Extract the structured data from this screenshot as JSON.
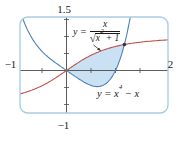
{
  "labels": {
    "curve1": {
      "pre": "y =",
      "num": "x",
      "radical_sign": "√",
      "rad_base": "x",
      "rad_exp": "2",
      "rad_tail": " + 1"
    },
    "curve2": {
      "pre": "y = x",
      "exp": "4",
      "post": " − x"
    }
  },
  "chart_data": {
    "type": "line",
    "title": "",
    "x_axis_range": [
      -1,
      2
    ],
    "y_axis_range": [
      -1,
      1.5
    ],
    "axes": {
      "x_ticks": [
        -0.5,
        0.5,
        1,
        1.5
      ],
      "y_ticks": [
        -1,
        -0.5,
        0.5,
        1,
        1.5
      ],
      "tick_step": 0.5,
      "x_min_label": "−1",
      "x_max_label": "2",
      "y_min_label": "−1",
      "y_max_label": "1.5"
    },
    "curves": [
      {
        "name": "y = x/sqrt(x^2+1)",
        "expr": "x/Math.sqrt(x*x+1)",
        "color": "#c1544a",
        "sample_range": [
          -0.95,
          2.09
        ]
      },
      {
        "name": "y = x^4 - x",
        "expr": "Math.pow(x,4)-x",
        "color": "#4e80b8",
        "sample_range": [
          -1.02,
          1.47
        ]
      }
    ],
    "region": {
      "x_from": 0,
      "x_to": 1.1811,
      "upper_curve": 0,
      "lower_curve": 1,
      "fill": "#c9e1f3"
    },
    "intersection_point": {
      "x": 1.1811,
      "y": 0.7628
    },
    "colors": {
      "frame": "#a9cce6",
      "axis": "#4a4a4a",
      "point": "#333333",
      "arrow": "#333333",
      "text": "#1a1a1a"
    }
  }
}
